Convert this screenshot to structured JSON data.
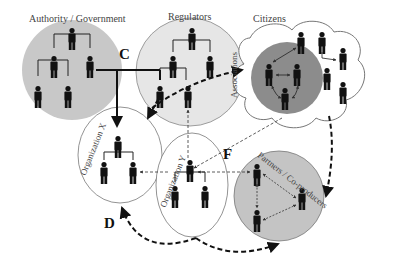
{
  "diagram": {
    "type": "network-governance-diagram",
    "colors": {
      "authority_fill": "#c8c8c8",
      "regulators_fill": "#e6e6e6",
      "associations_fill": "#8c8c8c",
      "partners_fill": "#c4c4c4",
      "outline": "#777777",
      "person": "#111111"
    },
    "groups": [
      {
        "id": "authority",
        "label": "Authority / Government"
      },
      {
        "id": "regulators",
        "label": "Regulators"
      },
      {
        "id": "citizens",
        "label": "Citizens"
      },
      {
        "id": "associations",
        "label": "Associations"
      },
      {
        "id": "org_x",
        "label": "Organization X"
      },
      {
        "id": "org_y",
        "label": "Organization Y"
      },
      {
        "id": "partners",
        "label": "Partners / Co-producers"
      }
    ],
    "markers": {
      "c": "C",
      "d": "D",
      "f": "F"
    },
    "edges": [
      {
        "from": "authority",
        "to": "org_x",
        "style": "solid-bold",
        "marker": "C"
      },
      {
        "from": "authority",
        "to": "regulators",
        "style": "solid-bold"
      },
      {
        "from": "regulators",
        "to": "associations",
        "style": "dashed-bold"
      },
      {
        "from": "regulators",
        "to": "org_x",
        "style": "dashed-bold"
      },
      {
        "from": "regulators",
        "to": "org_y",
        "style": "dashed-thin"
      },
      {
        "from": "associations",
        "to": "org_y",
        "style": "dashed-thin"
      },
      {
        "from": "citizens",
        "to": "partners",
        "style": "dashed-bold"
      },
      {
        "from": "org_y",
        "to": "org_x",
        "style": "dashed-thin"
      },
      {
        "from": "partners",
        "to": "org_y",
        "style": "dashed-thin",
        "marker": "F"
      },
      {
        "from": "org_y",
        "to": "org_x",
        "style": "dashed-bold-curve",
        "marker": "D"
      },
      {
        "from": "org_y",
        "to": "partners",
        "style": "dashed-bold-curve"
      }
    ]
  }
}
